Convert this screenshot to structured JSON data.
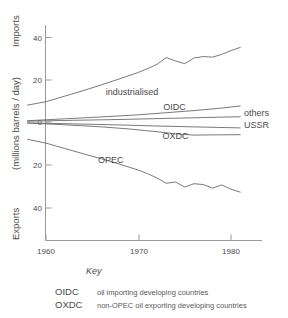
{
  "chart_data": {
    "type": "line",
    "title": "",
    "xlabel": "",
    "ylabel": "Exports   (millions barrels / day)   Imports",
    "ylabel_parts": {
      "exports": "Exports",
      "units": "(millions barrels / day)",
      "imports": "Imports"
    },
    "xlim": [
      1958,
      1982
    ],
    "ylim": [
      -50,
      47
    ],
    "grid": false,
    "legend_position": "inline-right",
    "x_ticks": [
      1960,
      1970,
      1980
    ],
    "x_tick_labels": [
      "1960",
      "1970",
      "1980"
    ],
    "y_ticks": [
      40,
      20,
      0,
      -20,
      -40
    ],
    "y_tick_labels": [
      "40",
      "20",
      "0",
      "20",
      "40"
    ],
    "axis_note": "Positive values are imports, negative values are exports",
    "series": [
      {
        "name": "industrialised",
        "label": "industrialised",
        "label_x": 1969.3,
        "label_y": 14.0,
        "x": [
          1958,
          1960,
          1962,
          1964,
          1966,
          1968,
          1970,
          1971,
          1972,
          1973,
          1974,
          1975,
          1976,
          1977,
          1978,
          1979,
          1980,
          1981
        ],
        "values": [
          8.0,
          9.6,
          12.2,
          14.8,
          17.6,
          20.5,
          23.5,
          25.3,
          27.3,
          30.5,
          28.9,
          27.6,
          30.3,
          31.0,
          30.7,
          32.0,
          33.8,
          35.3
        ]
      },
      {
        "name": "OIDC",
        "label": "OIDC",
        "label_x": 1973.9,
        "label_y": 7.1,
        "x": [
          1958,
          1962,
          1966,
          1970,
          1973,
          1976,
          1979,
          1981
        ],
        "values": [
          0.6,
          1.5,
          2.4,
          3.4,
          4.4,
          5.4,
          6.6,
          7.6
        ]
      },
      {
        "name": "others",
        "label": "others",
        "label_x": 1981.4,
        "label_y": 4.3,
        "x": [
          1958,
          1963,
          1968,
          1973,
          1977,
          1981
        ],
        "values": [
          0.4,
          0.8,
          1.2,
          1.7,
          2.1,
          2.5
        ]
      },
      {
        "name": "USSR",
        "label": "USSR",
        "label_x": 1981.4,
        "label_y": -1.4,
        "x": [
          1958,
          1963,
          1968,
          1972,
          1976,
          1981
        ],
        "values": [
          -0.4,
          -0.9,
          -1.4,
          -1.9,
          -2.3,
          -2.8
        ]
      },
      {
        "name": "OXDC",
        "label": "OXDC",
        "label_x": 1974.0,
        "label_y": -6.4,
        "x": [
          1958,
          1962,
          1966,
          1969,
          1972,
          1974,
          1976,
          1978,
          1981
        ],
        "values": [
          -0.5,
          -1.3,
          -2.3,
          -3.3,
          -4.6,
          -5.6,
          -6.2,
          -6.1,
          -6.0
        ]
      },
      {
        "name": "OPEC",
        "label": "OPEC",
        "label_x": 1967.0,
        "label_y": -17.8,
        "x": [
          1958,
          1960,
          1962,
          1964,
          1966,
          1968,
          1970,
          1971,
          1972,
          1973,
          1974,
          1975,
          1976,
          1977,
          1978,
          1979,
          1980,
          1981
        ],
        "values": [
          -8.2,
          -10.0,
          -12.5,
          -15.0,
          -17.4,
          -20.0,
          -22.8,
          -24.5,
          -26.5,
          -29.0,
          -28.4,
          -30.8,
          -29.2,
          -29.6,
          -31.3,
          -29.8,
          -31.8,
          -33.2
        ]
      }
    ]
  },
  "key": {
    "title": "Key",
    "entries": [
      {
        "abbr": "OIDC",
        "description": "oil importing developing countries"
      },
      {
        "abbr": "OXDC",
        "description": "non-OPEC oil exporting developing countries"
      }
    ]
  }
}
